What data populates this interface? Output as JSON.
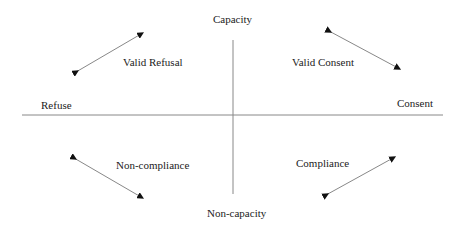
{
  "diagram": {
    "axes": {
      "top": "Capacity",
      "bottom": "Non-capacity",
      "left": "Refuse",
      "right": "Consent"
    },
    "quadrants": {
      "top_left": "Valid Refusal",
      "top_right": "Valid Consent",
      "bottom_left": "Non-compliance",
      "bottom_right": "Compliance"
    },
    "colors": {
      "line": "#888888",
      "arrowhead": "#111111",
      "text": "#222222"
    }
  }
}
